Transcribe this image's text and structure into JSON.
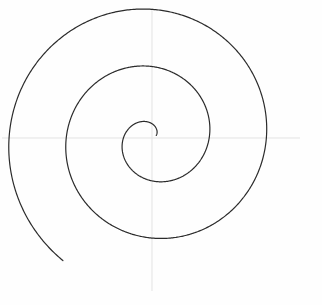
{
  "figure": {
    "background_color": "#fefefe",
    "width": 322,
    "height": 305
  },
  "axes": {
    "color": "#e3e3e3",
    "line_width": 1,
    "horizontal": {
      "name": "horizontal-axis",
      "y": 138,
      "x_start": 2,
      "x_end": 300
    },
    "vertical": {
      "name": "vertical-axis",
      "x": 152,
      "y_start": 8,
      "y_end": 291
    }
  },
  "chart_data": {
    "type": "line",
    "xlabel": "",
    "ylabel": "",
    "grid": false,
    "legend": null,
    "curve": {
      "name": "archimedean-spiral",
      "equation": "r = a * theta",
      "center_x": 152,
      "center_y": 138,
      "a": 9.1,
      "theta_start": 0.55,
      "theta_end": 16.65,
      "theta_units": "radians",
      "turns": 2.56,
      "direction": "counterclockwise-inward-to-outward",
      "start_angle_deg": 31,
      "end_angle_deg": 954,
      "stroke_color": "#2b2b2b",
      "stroke_width": 1.2,
      "r_min": 5,
      "r_max": 151
    },
    "axis_crossings": {
      "left_of_center_x": [
        128,
        74,
        24
      ],
      "right_of_center_x": [
        165,
        218,
        303
      ],
      "above_center_y": [
        122,
        75,
        22
      ],
      "below_center_y": [
        155,
        205,
        281
      ]
    },
    "xlim": [
      0,
      322
    ],
    "ylim": [
      0,
      305
    ]
  }
}
